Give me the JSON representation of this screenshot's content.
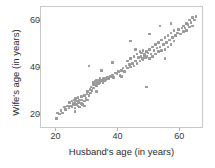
{
  "chart_data": {
    "type": "scatter",
    "title": "",
    "xlabel": "Husband's age (in years)",
    "ylabel": "Wife's age (in years)",
    "xlim": [
      15,
      67
    ],
    "ylim": [
      15,
      66
    ],
    "xticks": [
      20,
      40,
      60
    ],
    "yticks": [
      20,
      40,
      60
    ],
    "xtick_labels": [
      "20",
      "40",
      "60"
    ],
    "ytick_labels": [
      "20",
      "40",
      "60"
    ],
    "grid": false,
    "legend": null,
    "marker": {
      "shape": "square",
      "color": "#9a9a9a",
      "size": 2.6
    },
    "frame_color": "#c9c9c9",
    "background": "#ffffff",
    "series": [
      {
        "name": "couples",
        "x": [
          20.0,
          20.3,
          21.0,
          21.5,
          22.0,
          22.5,
          23.0,
          23.5,
          24.0,
          24.2,
          24.5,
          25.0,
          25.0,
          25.3,
          25.5,
          25.8,
          26.0,
          26.0,
          26.2,
          26.5,
          26.8,
          27.0,
          27.0,
          27.2,
          27.5,
          27.5,
          28.0,
          28.0,
          28.3,
          28.5,
          29.0,
          29.0,
          29.5,
          29.8,
          30.0,
          30.0,
          30.5,
          30.8,
          31.0,
          31.2,
          31.5,
          31.8,
          32.0,
          32.0,
          32.3,
          32.5,
          32.8,
          33.0,
          33.0,
          33.2,
          33.5,
          33.8,
          34.0,
          34.0,
          34.3,
          34.5,
          34.8,
          35.0,
          35.0,
          35.2,
          35.5,
          35.8,
          36.0,
          36.3,
          36.5,
          37.0,
          37.5,
          38.0,
          38.5,
          39.0,
          39.5,
          40.0,
          40.5,
          41.0,
          41.5,
          42.0,
          42.5,
          43.0,
          43.0,
          43.5,
          44.0,
          44.0,
          44.5,
          45.0,
          45.0,
          45.5,
          46.0,
          46.0,
          46.5,
          47.0,
          47.0,
          47.3,
          47.5,
          47.8,
          48.0,
          48.0,
          48.3,
          48.5,
          48.8,
          49.0,
          49.0,
          49.5,
          50.0,
          50.0,
          50.5,
          51.0,
          51.0,
          51.5,
          52.0,
          52.0,
          52.5,
          53.0,
          53.0,
          53.5,
          54.0,
          54.0,
          54.5,
          55.0,
          55.0,
          55.5,
          56.0,
          56.0,
          56.5,
          57.0,
          57.0,
          57.5,
          58.0,
          58.0,
          58.5,
          59.0,
          59.5,
          60.0,
          60.5,
          61.0,
          61.0,
          61.5,
          62.0,
          62.0,
          62.5,
          63.0,
          63.0,
          63.5,
          64.0,
          64.0,
          64.5,
          65.0,
          30.5,
          34.5,
          38.0,
          44.0,
          50.0,
          53.5,
          57.0,
          26.0,
          29.0,
          33.0,
          41.0,
          45.5,
          49.0,
          55.0
        ],
        "y": [
          18.5,
          21.0,
          20.5,
          22.0,
          21.0,
          23.5,
          22.5,
          24.0,
          23.0,
          25.5,
          24.0,
          23.5,
          26.0,
          25.0,
          24.5,
          26.5,
          23.0,
          25.5,
          27.0,
          24.5,
          26.0,
          24.0,
          27.5,
          25.5,
          23.5,
          26.5,
          25.0,
          28.0,
          26.5,
          24.5,
          26.0,
          28.5,
          27.0,
          29.0,
          26.5,
          30.0,
          28.5,
          31.0,
          29.5,
          32.0,
          30.5,
          33.0,
          31.5,
          34.0,
          33.0,
          34.5,
          33.5,
          32.5,
          35.0,
          34.0,
          33.5,
          35.0,
          34.0,
          35.5,
          34.5,
          35.0,
          34.5,
          34.0,
          35.5,
          35.0,
          34.5,
          35.5,
          35.0,
          35.5,
          36.0,
          35.5,
          36.5,
          37.0,
          36.0,
          38.0,
          37.5,
          38.5,
          37.0,
          39.0,
          40.0,
          38.5,
          41.0,
          40.0,
          43.0,
          41.5,
          40.5,
          44.0,
          42.0,
          41.0,
          45.0,
          43.0,
          42.0,
          46.0,
          44.5,
          43.0,
          47.0,
          45.0,
          46.5,
          44.0,
          43.5,
          47.5,
          45.5,
          46.0,
          44.5,
          45.0,
          47.0,
          46.5,
          44.0,
          48.0,
          46.0,
          45.0,
          49.0,
          47.5,
          46.0,
          50.0,
          48.5,
          47.0,
          51.0,
          49.0,
          47.5,
          52.0,
          50.0,
          48.0,
          53.0,
          51.0,
          49.0,
          54.0,
          52.0,
          50.0,
          55.0,
          53.0,
          51.5,
          56.0,
          54.0,
          55.0,
          56.5,
          54.5,
          57.0,
          55.5,
          58.0,
          57.0,
          56.0,
          59.0,
          58.5,
          57.5,
          60.5,
          59.5,
          58.0,
          61.5,
          60.5,
          62.0,
          41.0,
          39.0,
          42.5,
          51.5,
          54.5,
          58.0,
          59.0,
          21.5,
          24.0,
          30.0,
          36.5,
          48.0,
          32.0,
          44.0
        ]
      }
    ]
  }
}
